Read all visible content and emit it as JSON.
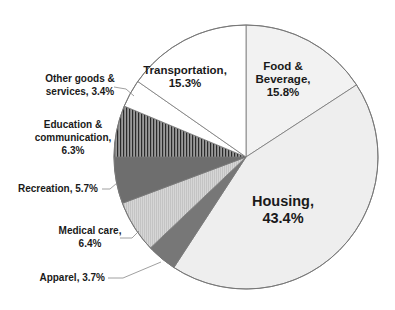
{
  "chart_data": {
    "type": "pie",
    "title": "",
    "start_angle_deg": 0,
    "direction": "clockwise",
    "slices": [
      {
        "label": "Food & Beverage",
        "value": 15.8,
        "display": [
          "Food &",
          "Beverage,",
          "15.8%"
        ],
        "fill": "#f2f2f2",
        "pattern": "none"
      },
      {
        "label": "Housing",
        "value": 43.4,
        "display": [
          "Housing,",
          "43.4%"
        ],
        "fill": "#eeeeee",
        "pattern": "none"
      },
      {
        "label": "Apparel",
        "value": 3.7,
        "display": [
          "Apparel, 3.7%"
        ],
        "fill": "#777777",
        "pattern": "none"
      },
      {
        "label": "Medical care",
        "value": 6.4,
        "display": [
          "Medical care,",
          "6.4%"
        ],
        "fill": "#d2d2d2",
        "pattern": "fine-vertical"
      },
      {
        "label": "Recreation",
        "value": 5.7,
        "display": [
          "Recreation, 5.7%"
        ],
        "fill": "#6e6e6e",
        "pattern": "none"
      },
      {
        "label": "Education & communication",
        "value": 6.3,
        "display": [
          "Education &",
          "communication,",
          "6.3%"
        ],
        "fill": "#8a8a8a",
        "pattern": "vertical-lines"
      },
      {
        "label": "Other goods & services",
        "value": 3.4,
        "display": [
          "Other goods &",
          "services, 3.4%"
        ],
        "fill": "#ffffff",
        "pattern": "none"
      },
      {
        "label": "Transportation",
        "value": 15.3,
        "display": [
          "Transportation,",
          "15.3%"
        ],
        "fill": "#ffffff",
        "pattern": "none"
      }
    ],
    "legend": "none"
  }
}
